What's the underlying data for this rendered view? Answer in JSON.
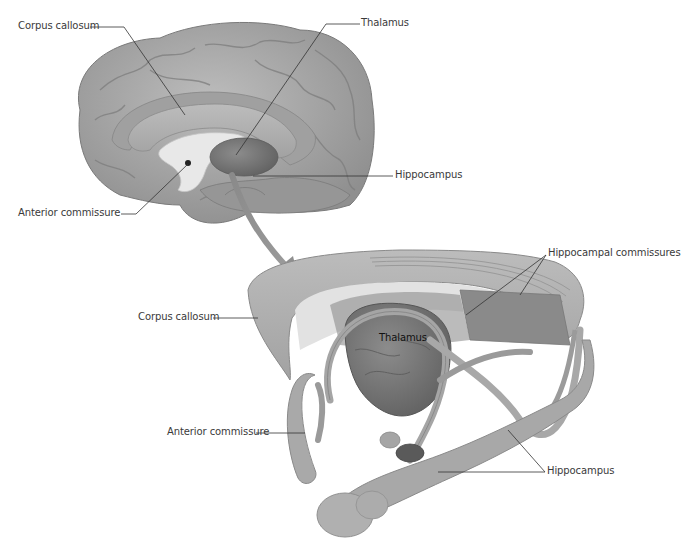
{
  "figure": {
    "top_panel": {
      "name": "Medial view of brain hemisphere",
      "labels": {
        "corpus_callosum": "Corpus callosum",
        "thalamus": "Thalamus",
        "hippocampus": "Hippocampus",
        "anterior_commissure": "Anterior commissure"
      }
    },
    "bottom_panel": {
      "name": "Isolated commissures and limbic structures",
      "labels": {
        "hippocampal_commissures": "Hippocampal commissures",
        "corpus_callosum": "Corpus callosum",
        "thalamus": "Thalamus",
        "anterior_commissure": "Anterior commissure",
        "hippocampus": "Hippocampus"
      }
    },
    "colors": {
      "background": "#ffffff",
      "cortex": "#a9a9a9",
      "cortex_dark": "#8c8c8c",
      "corpus_callosum": "#b5b5b5",
      "ventricle": "#e6e6e6",
      "thalamus": "#7a7a7a",
      "leader_line": "#333333",
      "label_text": "#3a3a3a"
    }
  }
}
